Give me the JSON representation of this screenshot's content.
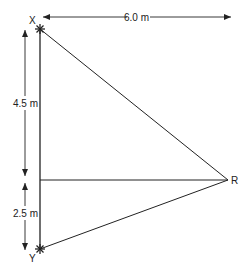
{
  "diagram": {
    "points": {
      "X": {
        "label": "X"
      },
      "Y": {
        "label": "Y"
      },
      "R": {
        "label": "R"
      }
    },
    "dimensions": {
      "horizontal": {
        "label": "6.0 m"
      },
      "upper_vertical": {
        "label": "4.5 m"
      },
      "lower_vertical": {
        "label": "2.5 m"
      }
    },
    "colors": {
      "line": "#222222",
      "background": "#ffffff"
    }
  }
}
